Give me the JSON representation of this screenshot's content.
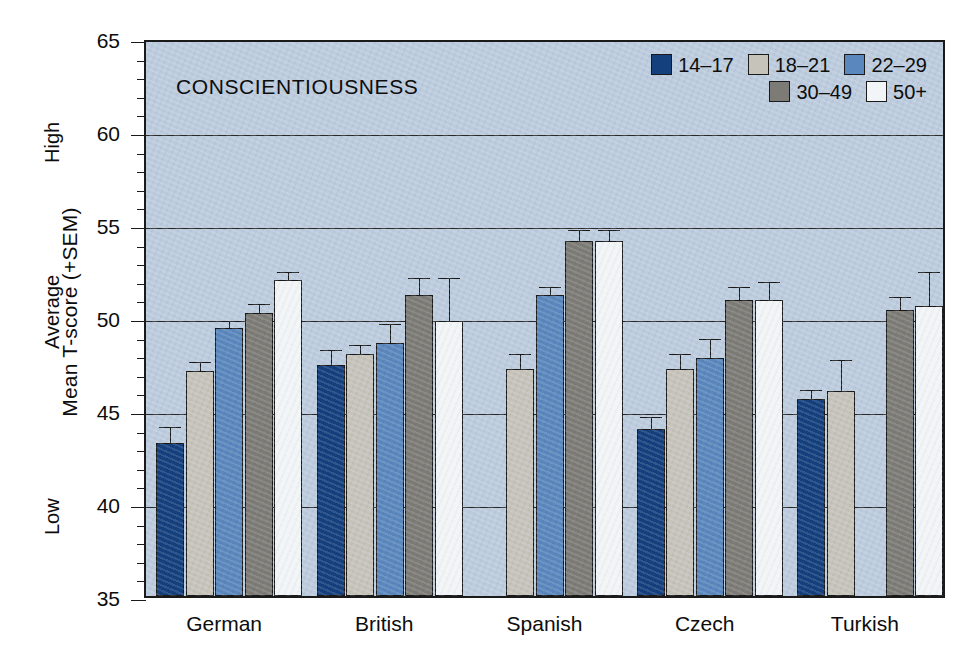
{
  "chart_data": {
    "type": "bar",
    "title": "CONSCIENTIOUSNESS",
    "xlabel": "",
    "ylabel": "Mean T-score (+SEM)",
    "ylim": [
      35,
      65
    ],
    "ytick_step": 5,
    "yminor_step": 1,
    "grid": true,
    "gridlines_at": [
      40,
      45,
      50,
      55,
      60
    ],
    "ytick_labels": [
      "35",
      "40",
      "45",
      "50",
      "55",
      "60",
      "65"
    ],
    "y_anchor_labels": [
      {
        "text": "Low",
        "at": 40
      },
      {
        "text": "Average",
        "at": 50
      },
      {
        "text": "High",
        "at": 60
      }
    ],
    "legend_position": "top-right",
    "categories": [
      "German",
      "British",
      "Spanish",
      "Czech",
      "Turkish"
    ],
    "series": [
      {
        "name": "14–17",
        "color": "#15407e",
        "values": [
          43.2,
          47.4,
          null,
          44.0,
          45.6
        ],
        "sem": [
          0.9,
          0.8,
          null,
          0.6,
          0.5
        ]
      },
      {
        "name": "18–21",
        "color": "#c6c3ba",
        "values": [
          47.1,
          48.0,
          47.2,
          47.2,
          46.0
        ],
        "sem": [
          0.5,
          0.5,
          0.8,
          0.8,
          1.7
        ]
      },
      {
        "name": "22–29",
        "color": "#5a87bd",
        "values": [
          49.4,
          48.6,
          51.2,
          47.8,
          null
        ],
        "sem": [
          0.4,
          1.0,
          0.4,
          1.0,
          null
        ]
      },
      {
        "name": "30–49",
        "color": "#7c7b76",
        "values": [
          50.2,
          51.2,
          54.1,
          50.9,
          50.4
        ],
        "sem": [
          0.5,
          0.9,
          0.6,
          0.7,
          0.7
        ]
      },
      {
        "name": "50+",
        "color": "#f2f5f7",
        "values": [
          52.0,
          49.8,
          54.1,
          50.9,
          50.6
        ],
        "sem": [
          0.4,
          2.3,
          0.6,
          1.0,
          1.8
        ]
      }
    ]
  },
  "legend": {
    "rows": [
      [
        {
          "label": "14–17",
          "color": "#15407e"
        },
        {
          "label": "18–21",
          "color": "#c6c3ba"
        },
        {
          "label": "22–29",
          "color": "#5a87bd"
        }
      ],
      [
        {
          "label": "30–49",
          "color": "#7c7b76"
        },
        {
          "label": "50+",
          "color": "#f2f5f7"
        }
      ]
    ]
  },
  "colors": {
    "plot_background": "#bcccde",
    "axis": "#1a1a1a",
    "page_background": "#ffffff"
  }
}
